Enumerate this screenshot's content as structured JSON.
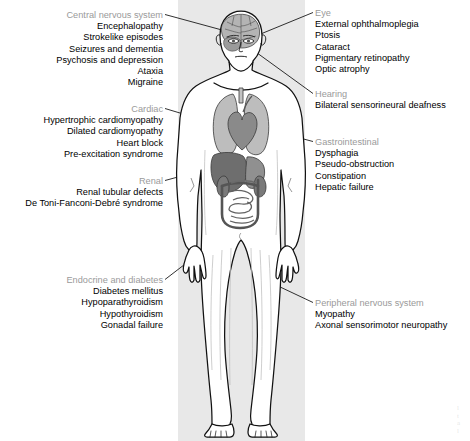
{
  "figure": {
    "type": "annotated-human-body-diagram",
    "panel_color": "#e8e8e8",
    "heading_color": "#9a9a9a",
    "item_color": "#000000",
    "leader_line_color": "#1a1a1a"
  },
  "callouts": {
    "cns": {
      "heading": "Central nervous system",
      "align": "right",
      "items": [
        "Encephalopathy",
        "Strokelike episodes",
        "Seizures and dementia",
        "Psychosis and depression",
        "Ataxia",
        "Migraine"
      ]
    },
    "cardiac": {
      "heading": "Cardiac",
      "align": "right",
      "items": [
        "Hypertrophic cardiomyopathy",
        "Dilated cardiomyopathy",
        "Heart block",
        "Pre-excitation syndrome"
      ]
    },
    "renal": {
      "heading": "Renal",
      "align": "right",
      "items": [
        "Renal tubular defects",
        "De Toni-Fanconi-Debré syndrome"
      ]
    },
    "endocrine": {
      "heading": "Endocrine and diabetes",
      "align": "right",
      "items": [
        "Diabetes mellitus",
        "Hypoparathyroidism",
        "Hypothyroidism",
        "Gonadal failure"
      ]
    },
    "eye": {
      "heading": "Eye",
      "align": "left",
      "items": [
        "External ophthalmoplegia",
        "Ptosis",
        "Cataract",
        "Pigmentary retinopathy",
        "Optic atrophy"
      ]
    },
    "hearing": {
      "heading": "Hearing",
      "align": "left",
      "items": [
        "Bilateral sensorineural deafness"
      ]
    },
    "gastrointestinal": {
      "heading": "Gastrointestinal",
      "align": "left",
      "items": [
        "Dysphagia",
        "Pseudo-obstruction",
        "Constipation",
        "Hepatic failure"
      ]
    },
    "peripheral_nervous_system": {
      "heading": "Peripheral nervous system",
      "align": "left",
      "items": [
        "Myopathy",
        "Axonal sensorimotor neuropathy"
      ]
    }
  },
  "anatomy": {
    "organs": [
      {
        "name": "brain",
        "shade": "#b4b4b4"
      },
      {
        "name": "eye",
        "shade": "#8e8e8e"
      },
      {
        "name": "lungs",
        "shade": "#b9b9b9"
      },
      {
        "name": "heart",
        "shade": "#8a8a8a"
      },
      {
        "name": "liver",
        "shade": "#6e6e6e"
      },
      {
        "name": "stomach",
        "shade": "#909090"
      },
      {
        "name": "kidney",
        "shade": "#7a7a7a"
      },
      {
        "name": "intestines",
        "shade": "#a8a8a8"
      },
      {
        "name": "colon",
        "shade": "#8f8f8f"
      }
    ],
    "body_fill": "#ffffff",
    "outline_color": "#111111"
  },
  "corner_mark": {
    "lines": [
      "l",
      "t",
      "a",
      "l",
      "e"
    ]
  }
}
